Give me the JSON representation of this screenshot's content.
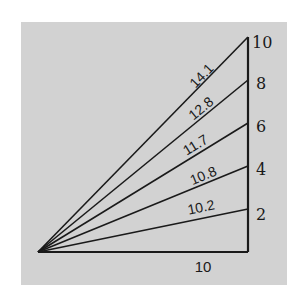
{
  "diagram": {
    "background_color": "#d2d2d2",
    "line_color": "#1a1a1a",
    "base": {
      "length": 10,
      "label": "10"
    },
    "vertical_ticks": [
      {
        "value": 10,
        "label": "10"
      },
      {
        "value": 8,
        "label": "8"
      },
      {
        "value": 6,
        "label": "6"
      },
      {
        "value": 4,
        "label": "4"
      },
      {
        "value": 2,
        "label": "2"
      }
    ],
    "hypotenuses": [
      {
        "height": 10,
        "length_label": "14.1"
      },
      {
        "height": 8,
        "length_label": "12.8"
      },
      {
        "height": 6,
        "length_label": "11.7"
      },
      {
        "height": 4,
        "length_label": "10.8"
      },
      {
        "height": 2,
        "length_label": "10.2"
      }
    ]
  }
}
